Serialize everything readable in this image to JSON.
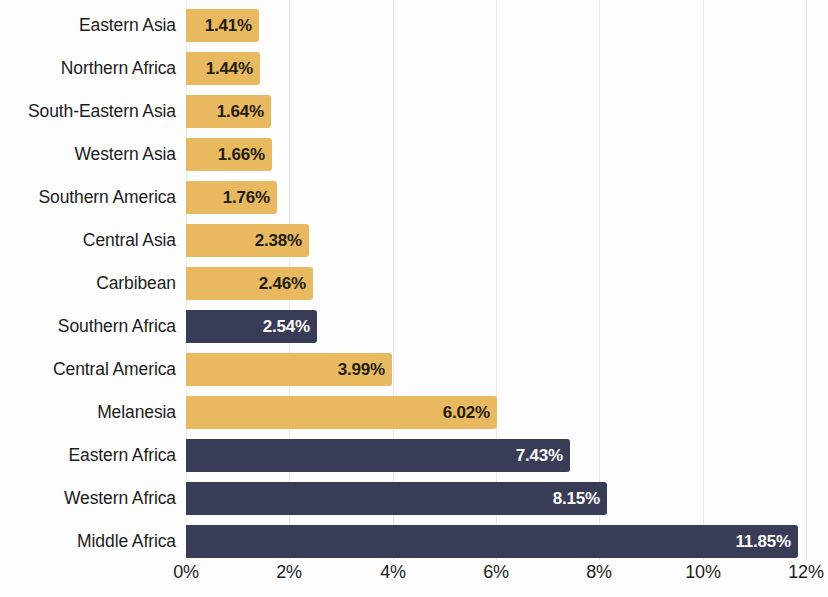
{
  "chart_data": {
    "type": "bar",
    "orientation": "horizontal",
    "title": "",
    "subtitle": "",
    "xlabel": "",
    "ylabel": "",
    "xlim": [
      0,
      12
    ],
    "grid": true,
    "legend": null,
    "x_tick_labels": [
      "0%",
      "2%",
      "4%",
      "6%",
      "8%",
      "10%",
      "12%"
    ],
    "x_tick_values": [
      0,
      2,
      4,
      6,
      8,
      10,
      12
    ],
    "value_suffix": "%",
    "colors": {
      "gold": "#e8b95e",
      "navy": "#383c56",
      "gold_label_text": "#231c0d",
      "navy_label_text": "#ffffff",
      "gridline": "#ececed",
      "background": "#fdfdfd",
      "category_text": "#1c1c1c"
    },
    "categories": [
      "Eastern Asia",
      "Northern Africa",
      "South-Eastern Asia",
      "Western Asia",
      "Southern America",
      "Central Asia",
      "Carbibean",
      "Southern Africa",
      "Central America",
      "Melanesia",
      "Eastern Africa",
      "Western Africa",
      "Middle Africa"
    ],
    "values": [
      1.41,
      1.44,
      1.64,
      1.66,
      1.76,
      2.38,
      2.46,
      2.54,
      3.99,
      6.02,
      7.43,
      8.15,
      11.85
    ],
    "value_labels": [
      "1.41%",
      "1.44%",
      "1.64%",
      "1.66%",
      "1.76%",
      "2.38%",
      "2.46%",
      "2.54%",
      "3.99%",
      "6.02%",
      "7.43%",
      "8.15%",
      "11.85%"
    ],
    "bar_colors": [
      "gold",
      "gold",
      "gold",
      "gold",
      "gold",
      "gold",
      "gold",
      "navy",
      "gold",
      "gold",
      "navy",
      "navy",
      "navy"
    ],
    "series": [
      {
        "name": "Share",
        "values": [
          1.41,
          1.44,
          1.64,
          1.66,
          1.76,
          2.38,
          2.46,
          2.54,
          3.99,
          6.02,
          7.43,
          8.15,
          11.85
        ]
      }
    ]
  }
}
